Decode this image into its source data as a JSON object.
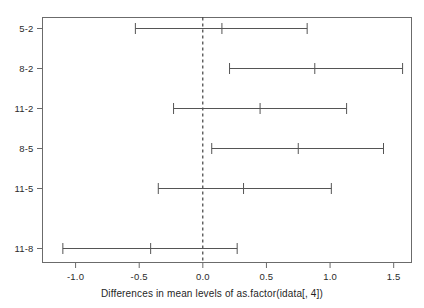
{
  "chart_data": {
    "type": "scatter",
    "title": "",
    "subtitle": "",
    "xlabel": "Differences in mean levels of as.factor(idata[, 4])",
    "ylabel": "",
    "xlim": [
      -1.26,
      1.64
    ],
    "xticks": [
      -1.0,
      -0.5,
      0.0,
      0.5,
      1.0,
      1.5
    ],
    "xticklabels": [
      "-1.0",
      "-0.5",
      "0.0",
      "0.5",
      "1.0",
      "1.5"
    ],
    "categories": [
      "5-2",
      "8-2",
      "11-2",
      "8-5",
      "11-5",
      "11-8"
    ],
    "reference_line": 0.0,
    "reference_line_style": "dashed",
    "grid": false,
    "legend": null,
    "series": [
      {
        "name": "difference",
        "values": [
          0.15,
          0.88,
          0.45,
          0.75,
          0.32,
          -0.41
        ]
      },
      {
        "name": "lower",
        "values": [
          -0.53,
          0.21,
          -0.23,
          0.07,
          -0.35,
          -1.1
        ]
      },
      {
        "name": "upper",
        "values": [
          0.82,
          1.57,
          1.13,
          1.42,
          1.01,
          0.27
        ]
      }
    ],
    "intervals": [
      {
        "label": "5-2",
        "lower": -0.53,
        "center": 0.15,
        "upper": 0.82
      },
      {
        "label": "8-2",
        "lower": 0.21,
        "center": 0.88,
        "upper": 1.57
      },
      {
        "label": "11-2",
        "lower": -0.23,
        "center": 0.45,
        "upper": 1.13
      },
      {
        "label": "8-5",
        "lower": 0.07,
        "center": 0.75,
        "upper": 1.42
      },
      {
        "label": "11-5",
        "lower": -0.35,
        "center": 0.32,
        "upper": 1.01
      },
      {
        "label": "11-8",
        "lower": -1.1,
        "center": -0.41,
        "upper": 0.27
      }
    ],
    "colors": {
      "line": "#555555",
      "frame": "#6b6b6b",
      "reference": "#1a1a1a",
      "text": "#2b2b2b",
      "background": "#ffffff"
    }
  }
}
